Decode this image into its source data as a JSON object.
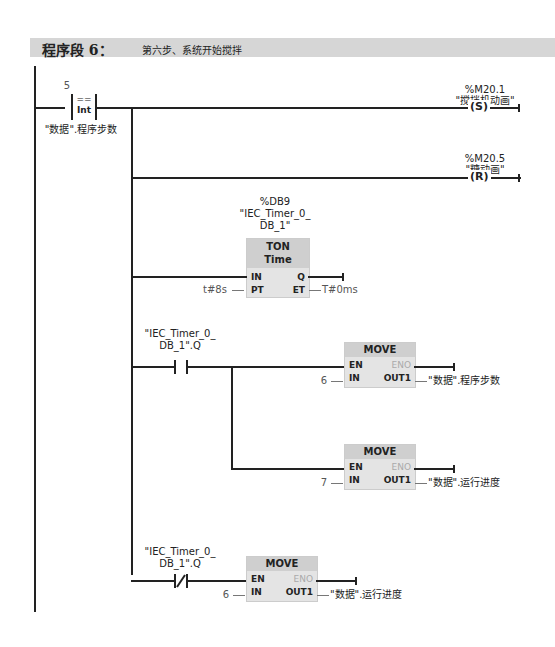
{
  "network": {
    "title": "程序段 6：",
    "comment": "第六步、系统开始搅拌"
  },
  "compare": {
    "value": "5",
    "op": "==",
    "type": "Int",
    "operand": "\"数据\".程序步数"
  },
  "coil_set": {
    "address": "%M20.1",
    "name": "\"搅拌机动画\"",
    "type": "S"
  },
  "coil_reset": {
    "address": "%M20.5",
    "name": "\"糖动画\"",
    "type": "R"
  },
  "timer": {
    "db": "%DB9",
    "instance_1": "\"IEC_Timer_0_",
    "instance_2": "DB_1\"",
    "type": "TON",
    "subtype": "Time",
    "in": "IN",
    "pt": "PT",
    "q": "Q",
    "et": "ET",
    "pt_value": "t#8s",
    "et_value": "T#0ms"
  },
  "contact_no": {
    "line1": "\"IEC_Timer_0_",
    "line2": "DB_1\".Q"
  },
  "contact_nc": {
    "line1": "\"IEC_Timer_0_",
    "line2": "DB_1\".Q"
  },
  "move": {
    "title": "MOVE",
    "en": "EN",
    "eno": "ENO",
    "in": "IN",
    "out": "OUT1"
  },
  "move1": {
    "in_value": "6",
    "out": "\"数据\".程序步数"
  },
  "move2": {
    "in_value": "7",
    "out": "\"数据\".运行进度"
  },
  "move3": {
    "in_value": "6",
    "out": "\"数据\".运行进度"
  }
}
